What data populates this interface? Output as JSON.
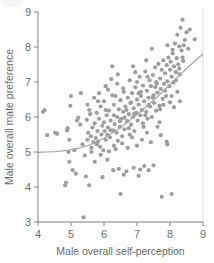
{
  "figure": {
    "background": "#fefefe",
    "point_color": "#9d9d9d",
    "axis_color": "#8d8d8d",
    "curve_color": "#a6a6a6",
    "text_color": "#6a6a6a"
  },
  "axes": {
    "x_title": "Male overall self-perception",
    "y_title": "Male overall mate preference",
    "x_ticks": [
      "4",
      "5",
      "6",
      "7",
      "8",
      "9"
    ],
    "y_ticks": [
      "3",
      "4",
      "5",
      "6",
      "7",
      "8",
      "9"
    ]
  },
  "chart_data": {
    "type": "scatter",
    "title": "",
    "xlabel": "Male overall self-perception",
    "ylabel": "Male overall mate preference",
    "xlim": [
      4,
      9
    ],
    "ylim": [
      3,
      9
    ],
    "xticks": [
      4,
      5,
      6,
      7,
      8,
      9
    ],
    "yticks": [
      3,
      4,
      5,
      6,
      7,
      8,
      9
    ],
    "grid": false,
    "legend": "none",
    "marker": {
      "shape": "circle",
      "size_px": 4.2,
      "color": "#9d9d9d"
    },
    "annotations": [
      "Positive association between male self-perception and male mate preference",
      "Smoothed fit curve rises from about 5.0 at x=4 to about 7.8 at x=9"
    ],
    "fit_curve": {
      "type": "smoothed",
      "color": "#a6a6a6",
      "x": [
        4.0,
        4.25,
        4.5,
        4.75,
        5.0,
        5.25,
        5.5,
        5.75,
        6.0,
        6.25,
        6.5,
        6.75,
        7.0,
        7.25,
        7.5,
        7.75,
        8.0,
        8.25,
        8.5,
        8.75,
        9.0
      ],
      "y": [
        4.99,
        5.0,
        5.01,
        5.03,
        5.06,
        5.11,
        5.18,
        5.28,
        5.4,
        5.54,
        5.7,
        5.88,
        6.07,
        6.27,
        6.48,
        6.7,
        6.93,
        7.16,
        7.38,
        7.6,
        7.8
      ]
    },
    "points": [
      [
        4.15,
        6.15
      ],
      [
        4.2,
        6.2
      ],
      [
        4.28,
        5.48
      ],
      [
        4.52,
        5.55
      ],
      [
        4.58,
        5.52
      ],
      [
        4.82,
        4.05
      ],
      [
        4.85,
        4.12
      ],
      [
        4.88,
        5.62
      ],
      [
        4.9,
        5.68
      ],
      [
        4.92,
        5.0
      ],
      [
        4.95,
        4.72
      ],
      [
        4.98,
        6.32
      ],
      [
        5.0,
        6.6
      ],
      [
        5.05,
        4.48
      ],
      [
        5.1,
        5.05
      ],
      [
        5.18,
        5.9
      ],
      [
        5.22,
        5.98
      ],
      [
        5.3,
        6.68
      ],
      [
        5.35,
        5.22
      ],
      [
        5.38,
        3.13
      ],
      [
        5.42,
        4.9
      ],
      [
        5.45,
        4.3
      ],
      [
        5.48,
        5.92
      ],
      [
        5.5,
        5.35
      ],
      [
        5.52,
        5.55
      ],
      [
        5.55,
        6.2
      ],
      [
        5.58,
        6.08
      ],
      [
        5.6,
        5.45
      ],
      [
        5.62,
        5.0
      ],
      [
        5.65,
        5.7
      ],
      [
        5.68,
        5.28
      ],
      [
        5.7,
        6.55
      ],
      [
        5.72,
        5.82
      ],
      [
        5.75,
        5.4
      ],
      [
        5.78,
        6.12
      ],
      [
        5.8,
        5.6
      ],
      [
        5.82,
        5.3
      ],
      [
        5.85,
        5.95
      ],
      [
        5.88,
        5.15
      ],
      [
        5.9,
        6.3
      ],
      [
        5.92,
        5.5
      ],
      [
        5.95,
        5.75
      ],
      [
        5.98,
        5.05
      ],
      [
        6.0,
        5.85
      ],
      [
        6.0,
        6.45
      ],
      [
        6.02,
        5.6
      ],
      [
        6.05,
        5.35
      ],
      [
        6.08,
        6.05
      ],
      [
        6.1,
        5.5
      ],
      [
        6.12,
        5.7
      ],
      [
        6.15,
        6.18
      ],
      [
        6.18,
        5.42
      ],
      [
        6.2,
        5.9
      ],
      [
        6.22,
        7.08
      ],
      [
        6.25,
        7.45
      ],
      [
        6.28,
        5.62
      ],
      [
        6.3,
        6.35
      ],
      [
        6.3,
        5.18
      ],
      [
        6.32,
        5.8
      ],
      [
        6.35,
        6.6
      ],
      [
        6.38,
        5.55
      ],
      [
        6.4,
        6.0
      ],
      [
        6.42,
        5.32
      ],
      [
        6.45,
        6.22
      ],
      [
        6.48,
        5.72
      ],
      [
        6.5,
        6.48
      ],
      [
        6.5,
        3.8
      ],
      [
        6.52,
        5.95
      ],
      [
        6.55,
        5.45
      ],
      [
        6.58,
        6.15
      ],
      [
        6.6,
        6.72
      ],
      [
        6.62,
        5.65
      ],
      [
        6.65,
        6.3
      ],
      [
        6.68,
        4.45
      ],
      [
        6.7,
        5.88
      ],
      [
        6.72,
        6.55
      ],
      [
        6.75,
        6.08
      ],
      [
        6.78,
        5.5
      ],
      [
        6.8,
        6.4
      ],
      [
        6.82,
        5.78
      ],
      [
        6.85,
        6.68
      ],
      [
        6.88,
        6.0
      ],
      [
        6.9,
        6.25
      ],
      [
        6.92,
        5.6
      ],
      [
        6.95,
        6.85
      ],
      [
        6.98,
        6.12
      ],
      [
        7.0,
        6.5
      ],
      [
        7.0,
        7.0
      ],
      [
        7.02,
        5.9
      ],
      [
        7.05,
        6.35
      ],
      [
        7.08,
        7.15
      ],
      [
        7.1,
        6.05
      ],
      [
        7.12,
        6.6
      ],
      [
        7.15,
        6.2
      ],
      [
        7.18,
        6.9
      ],
      [
        7.2,
        5.72
      ],
      [
        7.22,
        6.45
      ],
      [
        7.25,
        7.3
      ],
      [
        7.28,
        6.15
      ],
      [
        7.3,
        6.75
      ],
      [
        7.32,
        5.95
      ],
      [
        7.35,
        6.55
      ],
      [
        7.38,
        7.05
      ],
      [
        7.4,
        6.3
      ],
      [
        7.42,
        6.88
      ],
      [
        7.45,
        6.0
      ],
      [
        7.48,
        7.2
      ],
      [
        7.5,
        6.62
      ],
      [
        7.52,
        6.4
      ],
      [
        7.55,
        7.42
      ],
      [
        7.58,
        6.18
      ],
      [
        7.6,
        6.95
      ],
      [
        7.62,
        6.7
      ],
      [
        7.65,
        7.52
      ],
      [
        7.68,
        6.32
      ],
      [
        7.7,
        7.1
      ],
      [
        7.72,
        6.8
      ],
      [
        7.75,
        7.35
      ],
      [
        7.78,
        6.52
      ],
      [
        7.8,
        7.62
      ],
      [
        7.82,
        6.95
      ],
      [
        7.85,
        7.25
      ],
      [
        7.88,
        6.6
      ],
      [
        7.9,
        7.48
      ],
      [
        7.92,
        7.02
      ],
      [
        7.95,
        7.7
      ],
      [
        7.98,
        6.88
      ],
      [
        8.0,
        7.35
      ],
      [
        8.02,
        7.58
      ],
      [
        8.05,
        7.15
      ],
      [
        8.08,
        7.82
      ],
      [
        8.1,
        6.98
      ],
      [
        8.12,
        7.45
      ],
      [
        8.15,
        8.1
      ],
      [
        8.18,
        7.28
      ],
      [
        8.2,
        7.68
      ],
      [
        8.22,
        8.35
      ],
      [
        8.25,
        7.5
      ],
      [
        8.28,
        8.02
      ],
      [
        8.3,
        7.22
      ],
      [
        8.32,
        8.55
      ],
      [
        8.35,
        7.9
      ],
      [
        8.38,
        8.78
      ],
      [
        8.4,
        7.6
      ],
      [
        8.45,
        8.2
      ],
      [
        8.5,
        8.42
      ],
      [
        8.55,
        7.95
      ],
      [
        8.6,
        8.5
      ],
      [
        8.75,
        8.22
      ],
      [
        8.42,
        8.05
      ],
      [
        7.45,
        7.95
      ],
      [
        6.95,
        7.28
      ],
      [
        6.78,
        7.05
      ],
      [
        7.9,
        5.3
      ],
      [
        7.92,
        5.22
      ],
      [
        7.75,
        3.72
      ],
      [
        8.05,
        3.8
      ],
      [
        7.1,
        4.5
      ],
      [
        7.05,
        4.32
      ],
      [
        6.9,
        4.55
      ],
      [
        7.22,
        4.6
      ],
      [
        7.35,
        4.48
      ],
      [
        7.5,
        4.62
      ],
      [
        6.6,
        4.35
      ],
      [
        6.45,
        4.52
      ],
      [
        6.28,
        4.48
      ],
      [
        5.95,
        4.28
      ],
      [
        5.55,
        4.05
      ],
      [
        5.15,
        4.38
      ],
      [
        7.62,
        5.72
      ],
      [
        7.68,
        5.85
      ],
      [
        7.72,
        5.48
      ],
      [
        8.0,
        6.42
      ],
      [
        8.12,
        6.28
      ],
      [
        8.22,
        6.72
      ],
      [
        8.3,
        6.45
      ],
      [
        8.05,
        6.6
      ],
      [
        5.85,
        6.68
      ],
      [
        6.05,
        6.88
      ],
      [
        6.4,
        6.95
      ],
      [
        6.15,
        5.02
      ],
      [
        6.35,
        5.08
      ],
      [
        6.55,
        5.25
      ],
      [
        6.72,
        5.12
      ],
      [
        7.15,
        5.35
      ],
      [
        7.3,
        5.55
      ],
      [
        7.42,
        5.28
      ],
      [
        6.85,
        5.42
      ],
      [
        7.0,
        5.18
      ],
      [
        5.72,
        4.72
      ],
      [
        5.9,
        4.92
      ],
      [
        6.1,
        4.78
      ],
      [
        6.25,
        6.62
      ],
      [
        6.58,
        6.82
      ],
      [
        6.82,
        6.42
      ],
      [
        7.05,
        6.68
      ],
      [
        7.25,
        6.05
      ],
      [
        7.55,
        6.85
      ],
      [
        7.8,
        6.35
      ],
      [
        8.18,
        7.05
      ],
      [
        6.68,
        6.2
      ],
      [
        6.92,
        6.1
      ],
      [
        7.12,
        6.72
      ],
      [
        7.32,
        7.15
      ],
      [
        7.58,
        7.0
      ],
      [
        7.85,
        6.75
      ],
      [
        8.08,
        7.92
      ],
      [
        6.2,
        5.62
      ],
      [
        6.48,
        5.88
      ],
      [
        6.62,
        5.98
      ],
      [
        5.62,
        5.12
      ],
      [
        5.78,
        5.22
      ],
      [
        5.5,
        6.35
      ],
      [
        5.28,
        5.78
      ],
      [
        4.95,
        5.35
      ],
      [
        6.05,
        6.2
      ],
      [
        6.3,
        6.05
      ],
      [
        7.35,
        6.35
      ],
      [
        7.48,
        6.55
      ],
      [
        8.28,
        7.38
      ],
      [
        6.75,
        5.68
      ],
      [
        7.18,
        5.82
      ],
      [
        7.7,
        6.22
      ],
      [
        6.12,
        6.78
      ],
      [
        6.42,
        7.22
      ],
      [
        7.28,
        7.62
      ],
      [
        7.92,
        8.05
      ],
      [
        8.38,
        7.7
      ],
      [
        5.82,
        6.45
      ],
      [
        6.88,
        7.45
      ]
    ]
  }
}
